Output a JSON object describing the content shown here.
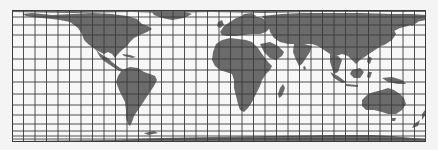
{
  "map": {
    "projection": "mercator-like world map",
    "graticule": {
      "meridian_spacing_deg": 10,
      "meridian_count": 36,
      "parallel_lines_y": [
        0,
        7,
        15,
        25,
        37,
        49,
        60,
        72,
        84,
        95,
        105,
        114,
        121,
        126,
        129,
        132
      ]
    },
    "colors": {
      "background": "#f4f4f4",
      "ocean": "#f7f7f7",
      "land": "#6b6b6b",
      "grid": "#3a3a3a"
    },
    "regions": [
      "north-america",
      "greenland",
      "central-america",
      "caribbean",
      "south-america",
      "europe",
      "africa",
      "madagascar",
      "asia",
      "arabia",
      "india",
      "japan",
      "southeast-asia",
      "indonesia",
      "new-guinea",
      "australia",
      "tasmania",
      "new-zealand",
      "antarctica"
    ]
  }
}
